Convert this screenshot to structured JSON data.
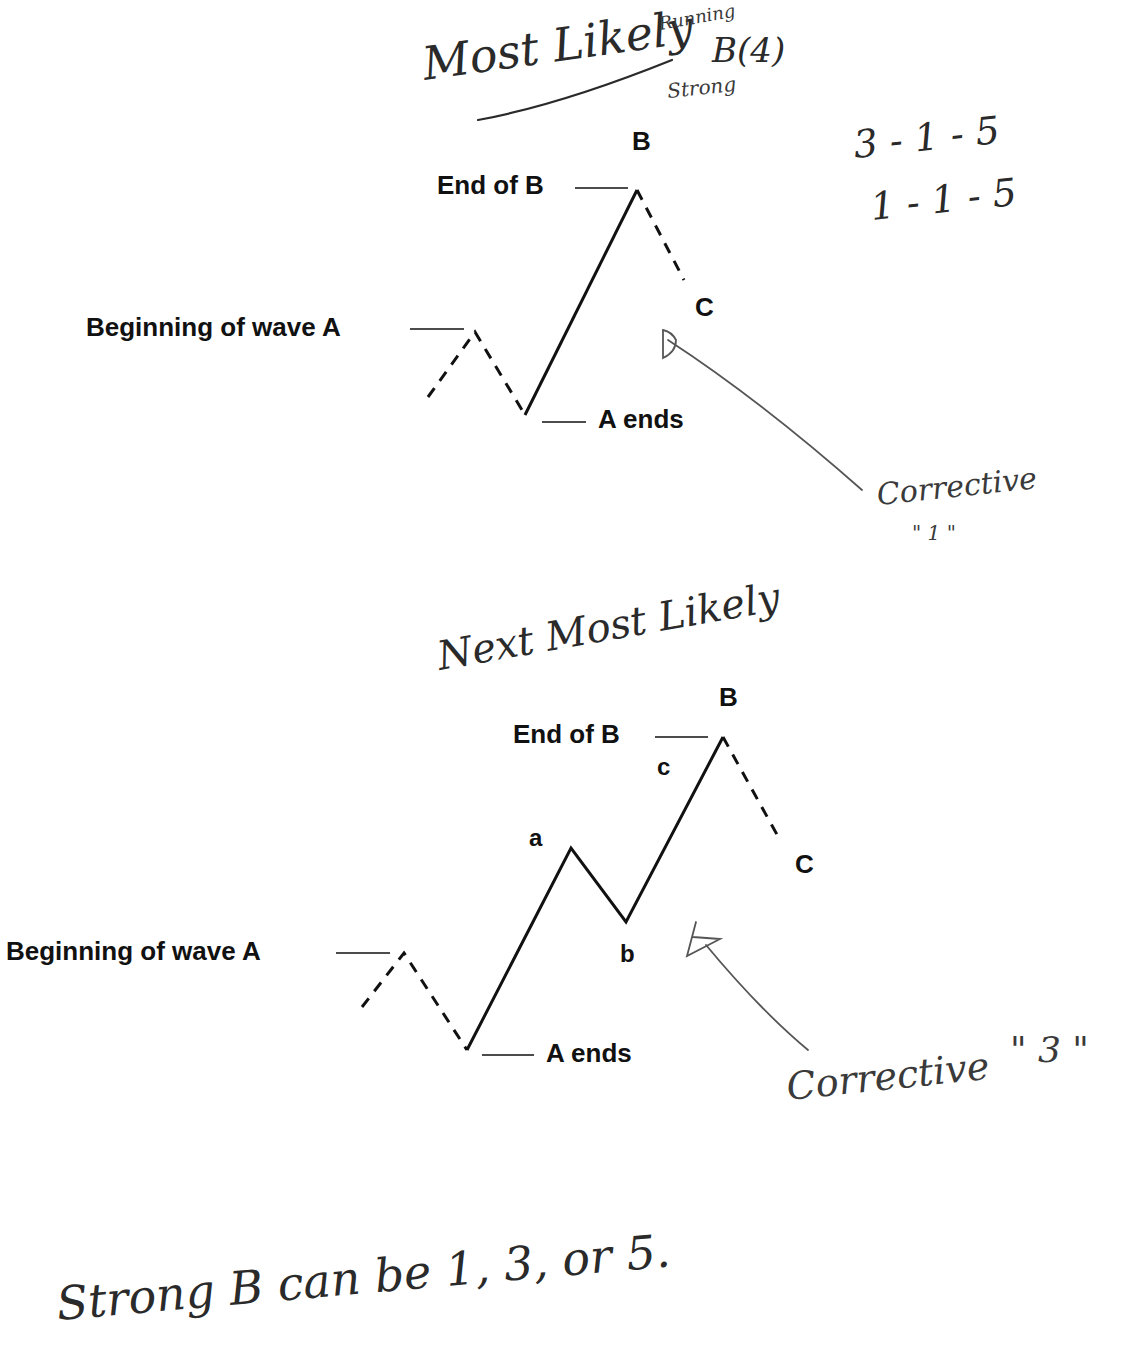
{
  "page": {
    "background": "#ffffff",
    "ink_color": "#111111",
    "pencil_color": "#555555"
  },
  "header_annotation": {
    "main": "Most Likely",
    "above": "Running",
    "below": "Strong",
    "label": "B(4)"
  },
  "side_notes": {
    "line1": "3 - 1 - 5",
    "line2": "1 - 1 - 5"
  },
  "diagram1": {
    "peak_label": "B",
    "end_of_b": "End of B",
    "c_label": "C",
    "beginning": "Beginning of wave A",
    "a_ends": "A ends",
    "annotation": {
      "text": "Corrective",
      "sub": "\" 1 \""
    }
  },
  "middle_note": "Next Most Likely",
  "diagram2": {
    "peak_label": "B",
    "end_of_b": "End of B",
    "sub_a": "a",
    "sub_b": "b",
    "sub_c": "c",
    "c_label": "C",
    "beginning": "Beginning of wave A",
    "a_ends": "A ends",
    "annotation": {
      "text": "Corrective",
      "quote": "\" 3 \""
    }
  },
  "footer_note": "Strong B can be 1, 3, or 5."
}
